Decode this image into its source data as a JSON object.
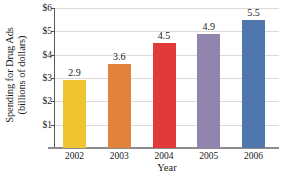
{
  "chart_data": {
    "type": "bar",
    "title": "",
    "subtitle": "",
    "xlabel": "Year",
    "ylabel": "Spending for Drug Ads (billions of dollars)",
    "ylabel_lines": [
      "Spending for Drug Ads",
      "(billions of dollars)"
    ],
    "categories": [
      "2002",
      "2003",
      "2004",
      "2005",
      "2006"
    ],
    "values": [
      2.9,
      3.6,
      4.5,
      4.9,
      5.5
    ],
    "value_labels": [
      "2.9",
      "3.6",
      "4.5",
      "4.9",
      "5.5"
    ],
    "ylim": [
      0,
      6
    ],
    "yticks": [
      1,
      2,
      3,
      4,
      5,
      6
    ],
    "ytick_labels": [
      "$1",
      "$2",
      "$3",
      "$4",
      "$5",
      "$6"
    ],
    "grid": true,
    "legend": "none",
    "bar_colors": [
      "#EFC431",
      "#E2833D",
      "#E23A3A",
      "#9184AE",
      "#4F77AE"
    ],
    "units": "billions of dollars"
  }
}
